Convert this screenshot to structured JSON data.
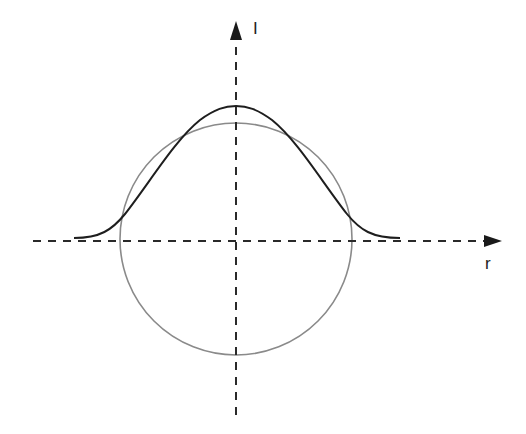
{
  "diagram": {
    "axes": {
      "vertical_label": "I",
      "horizontal_label": "r",
      "origin": [
        236,
        241
      ],
      "style": "dashed",
      "color": "#2a2a2a"
    },
    "curves": [
      {
        "name": "gaussian-profile",
        "type": "bell-curve",
        "color": "#1e1e1e",
        "peak_y": 107,
        "x_range": [
          74,
          400
        ],
        "baseline_y": 238
      },
      {
        "name": "circle",
        "type": "circle",
        "color": "#808080",
        "center": [
          236,
          239
        ],
        "radius": 116
      }
    ]
  }
}
